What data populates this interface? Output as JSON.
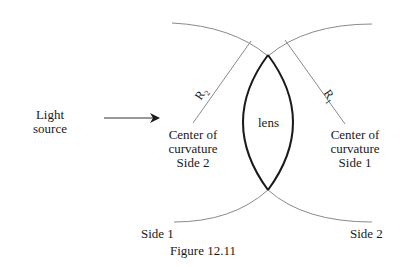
{
  "diagram": {
    "title": "Figure 12.11",
    "light_source": {
      "line1": "Light",
      "line2": "source"
    },
    "lens_label": "lens",
    "center_side2": {
      "line1": "Center of",
      "line2": "curvature",
      "line3": "Side 2"
    },
    "center_side1": {
      "line1": "Center of",
      "line2": "curvature",
      "line3": "Side 1"
    },
    "radius_left": {
      "base": "R",
      "sub": "2"
    },
    "radius_right": {
      "base": "R",
      "sub": "1"
    },
    "side_left_label": "Side 1",
    "side_right_label": "Side 2",
    "colors": {
      "lens_stroke": "#1a1a1a",
      "arc_stroke": "#8a8a8a",
      "text": "#1a1a1a"
    }
  }
}
